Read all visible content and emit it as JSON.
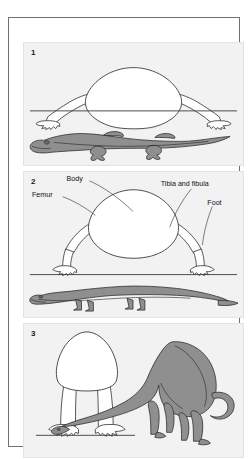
{
  "figure": {
    "panels": [
      {
        "number": "1",
        "name": "sprawling-posture",
        "front_view_description": "Front view outline of sprawling limbs with broad body",
        "side_view_description": "Side view of sprawling amphibian with belly near ground",
        "labels": []
      },
      {
        "number": "2",
        "name": "semi-erect-posture",
        "front_view_description": "Front view outline of semi-erect limbs with labelled bones",
        "side_view_description": "Side view of semi-erect crocodile-like reptile",
        "labels": [
          {
            "id": "body",
            "text": "Body"
          },
          {
            "id": "femur",
            "text": "Femur"
          },
          {
            "id": "tibia-and-fibula",
            "text": "Tibia and fibula"
          },
          {
            "id": "foot",
            "text": "Foot"
          }
        ]
      },
      {
        "number": "3",
        "name": "erect-posture",
        "front_view_description": "Front view outline of erect limbs held under the body",
        "side_view_description": "Side view of erect dinosaur-like reptile with curled tail",
        "labels": []
      }
    ]
  },
  "colors": {
    "page_background": "#ffffff",
    "panel_background": "#f2f2f2",
    "frame_stroke": "#6e7277",
    "animal_fill": "#8f8f8f",
    "animal_shadow": "#6d6d6d",
    "outline_fill": "#ffffff",
    "ink": "#2e2e2e",
    "label_text": "#111111"
  }
}
